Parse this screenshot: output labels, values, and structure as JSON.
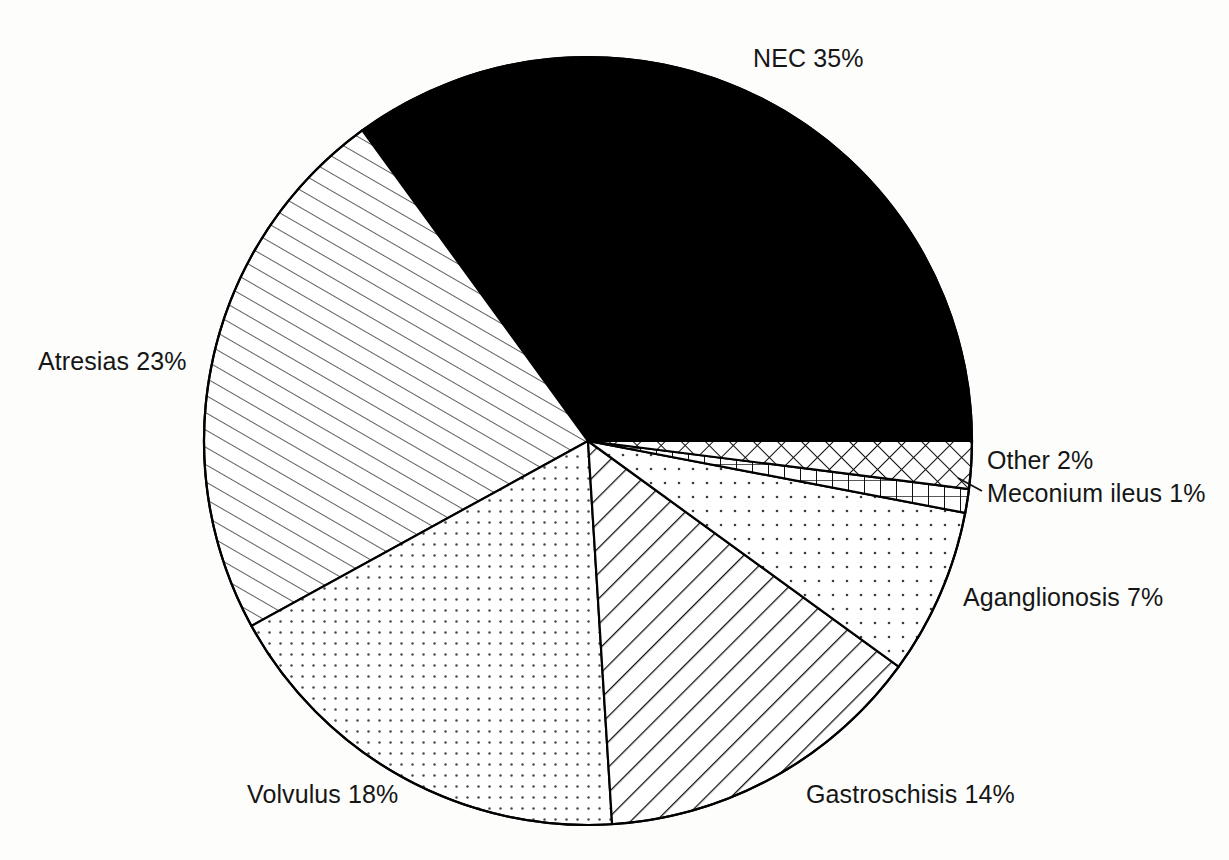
{
  "chart_data": {
    "type": "pie",
    "title": "",
    "subtitle": "",
    "xlabel": "",
    "ylabel": "",
    "legend_position": "none",
    "grid": false,
    "units": "percent",
    "total": 100,
    "start_angle_deg": 0,
    "direction": "counterclockwise",
    "categories": [
      "NEC",
      "Atresias",
      "Volvulus",
      "Gastroschisis",
      "Aganglionosis",
      "Meconium ileus",
      "Other"
    ],
    "values": [
      35,
      23,
      18,
      14,
      7,
      1,
      2
    ],
    "labels": [
      "NEC 35%",
      "Atresias 23%",
      "Volvulus 18%",
      "Gastroschisis 14%",
      "Aganglionosis 7%",
      "Meconium ileus 1%",
      "Other 2%"
    ],
    "slices": [
      {
        "name": "NEC",
        "value": 35,
        "label": "NEC 35%",
        "fill": "solid-black",
        "color": "#000000"
      },
      {
        "name": "Atresias",
        "value": 23,
        "label": "Atresias 23%",
        "fill": "diagonal-thin",
        "color": "#ffffff"
      },
      {
        "name": "Volvulus",
        "value": 18,
        "label": "Volvulus 18%",
        "fill": "dots-dense",
        "color": "#ffffff"
      },
      {
        "name": "Gastroschisis",
        "value": 14,
        "label": "Gastroschisis 14%",
        "fill": "diagonal-thick",
        "color": "#ffffff"
      },
      {
        "name": "Aganglionosis",
        "value": 7,
        "label": "Aganglionosis 7%",
        "fill": "dots-sparse",
        "color": "#ffffff"
      },
      {
        "name": "Meconium ileus",
        "value": 1,
        "label": "Meconium ileus 1%",
        "fill": "grid-vertical",
        "color": "#ffffff"
      },
      {
        "name": "Other",
        "value": 2,
        "label": "Other 2%",
        "fill": "crosshatch",
        "color": "#ffffff"
      }
    ]
  },
  "figure": {
    "background": "#fdfdfc",
    "outline_color": "#000000",
    "center_x": 588,
    "center_y": 441,
    "radius": 384
  }
}
